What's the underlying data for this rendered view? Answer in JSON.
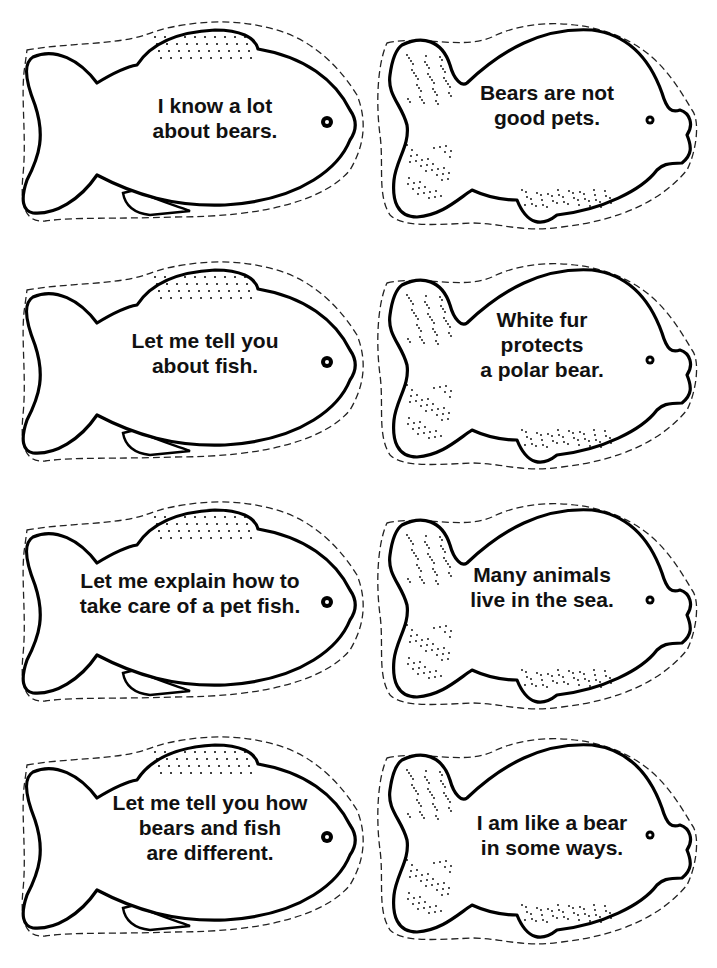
{
  "cards": [
    {
      "style": "long-fish",
      "text": "I know a lot\nabout bears."
    },
    {
      "style": "round-fish",
      "text": "Bears are not\ngood pets."
    },
    {
      "style": "long-fish",
      "text": "Let me tell you\nabout fish."
    },
    {
      "style": "round-fish",
      "text": "White fur\nprotects\na polar bear."
    },
    {
      "style": "long-fish",
      "text": "Let me explain how to\ntake care of a pet fish."
    },
    {
      "style": "round-fish",
      "text": "Many animals\nlive in the sea."
    },
    {
      "style": "long-fish",
      "text": "Let me tell you how\nbears and fish\nare different."
    },
    {
      "style": "round-fish",
      "text": "I am like a bear\nin some ways."
    }
  ]
}
